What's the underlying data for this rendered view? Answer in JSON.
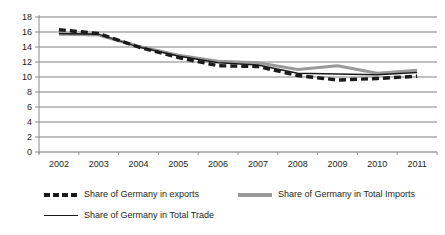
{
  "chart_data": {
    "type": "line",
    "title": "",
    "xlabel": "",
    "ylabel": "",
    "categories": [
      "2002",
      "2003",
      "2004",
      "2005",
      "2006",
      "2007",
      "2008",
      "2009",
      "2010",
      "2011"
    ],
    "ylim": [
      0,
      18
    ],
    "yticks": [
      0,
      2,
      4,
      6,
      8,
      10,
      12,
      14,
      16,
      18
    ],
    "grid": true,
    "legend_position": "bottom",
    "series": [
      {
        "name": "Share of Germany in exports",
        "style": "dashed",
        "color": "#1a1a1a",
        "values": [
          16.3,
          15.8,
          14.0,
          12.6,
          11.5,
          11.4,
          10.2,
          9.6,
          9.8,
          10.1
        ]
      },
      {
        "name": "Share of Germany in Total Imports",
        "style": "solid-thick",
        "color": "#9a9a9a",
        "values": [
          15.7,
          15.6,
          14.1,
          12.9,
          12.1,
          11.9,
          11.0,
          11.5,
          10.5,
          10.9
        ]
      },
      {
        "name": "Share of Germany in Total Trade",
        "style": "solid-thin",
        "color": "#1a1a1a",
        "values": [
          15.8,
          15.7,
          14.0,
          12.8,
          11.9,
          11.6,
          10.5,
          10.4,
          10.3,
          10.6
        ]
      }
    ]
  },
  "axis": {
    "y_labels": [
      "18",
      "16",
      "14",
      "12",
      "10",
      "8",
      "6",
      "4",
      "2",
      "0"
    ],
    "x_labels": [
      "2002",
      "2003",
      "2004",
      "2005",
      "2006",
      "2007",
      "2008",
      "2009",
      "2010",
      "2011"
    ]
  },
  "legend": {
    "items": [
      {
        "label": "Share of Germany in exports",
        "swatch": "dashed-line-swatch"
      },
      {
        "label": "Share of Germany in Total Imports",
        "swatch": "gray-line-swatch"
      },
      {
        "label": "Share of Germany in Total Trade",
        "swatch": "solid-line-swatch"
      }
    ]
  },
  "colors": {
    "exports": "#1a1a1a",
    "imports": "#9a9a9a",
    "total_trade": "#1a1a1a",
    "grid": "#6f6f6f",
    "axis": "#8a8a8a",
    "background": "#ffffff"
  }
}
